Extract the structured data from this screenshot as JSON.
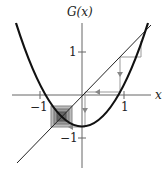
{
  "figure": {
    "y_axis_label": "G(x)",
    "x_axis_label": "x",
    "ticks": {
      "x_neg": "−1",
      "x_pos": "1",
      "y_pos": "1",
      "y_neg": "−1"
    }
  },
  "diagram": {
    "type": "cobweb",
    "function": "G(x) = x^2 - 0.75",
    "diagonal": "y = x",
    "fixed_points": [
      [
        -0.5,
        -0.5
      ],
      [
        1.5,
        1.5
      ]
    ],
    "cobweb_points": [
      [
        1.4,
        1.21
      ],
      [
        1.21,
        0.71
      ],
      [
        0.9,
        0.06
      ],
      [
        0.06,
        -0.75
      ],
      [
        -0.5,
        -0.5
      ]
    ],
    "colors": {
      "curve": "#111111",
      "line": "#222222",
      "cobweb": "#999999",
      "box": "#777777"
    }
  }
}
